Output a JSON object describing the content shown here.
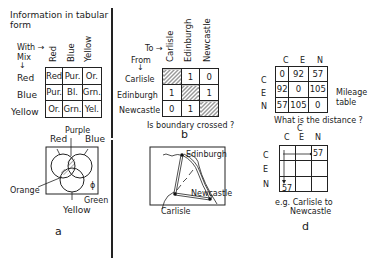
{
  "panel_a": {
    "title_line1": "Information in tabular",
    "title_line2": "form",
    "with_label": "With →",
    "mix_label": "Mix",
    "mix_arrow": "↓",
    "col_headers": [
      "Red",
      "Blue",
      "Yellow"
    ],
    "row_headers": [
      "Red",
      "Blue",
      "Yellow"
    ],
    "cells": [
      [
        "Red",
        "Pur.",
        "Or."
      ],
      [
        "Pur.",
        "Bl.",
        "Grn."
      ],
      [
        "Or.",
        "Grn.",
        "Yel."
      ]
    ],
    "venn_labels": {
      "purple": "Purple",
      "red": "Red",
      "blue": "Blue",
      "orange": "Orange",
      "green": "Green",
      "yellow": "Yellow",
      "phi": "ϕ"
    },
    "caption": "a"
  },
  "panel_b": {
    "to_label": "To →",
    "from_label": "From",
    "from_arrow": "↓",
    "col_headers": [
      "Carlisle",
      "Edinburgh",
      "Newcastle"
    ],
    "row_headers": [
      "Carlisle",
      "Edinburgh",
      "Newcastle"
    ],
    "cells": [
      [
        "",
        "1",
        "0"
      ],
      [
        "1",
        "",
        "1"
      ],
      [
        "0",
        "1",
        ""
      ]
    ],
    "question": "Is boundary crossed ?",
    "caption": "b"
  },
  "panel_c": {
    "map_labels": {
      "edinburgh": "Edinburgh",
      "newcastle": "Newcastle",
      "carlisle": "Carlisle"
    }
  },
  "panel_d": {
    "col_headers": [
      "C",
      "E",
      "N"
    ],
    "row_headers": [
      "C",
      "E",
      "N"
    ],
    "cells": [
      [
        "0",
        "92",
        "57"
      ],
      [
        "92",
        "0",
        "105"
      ],
      [
        "57",
        "105",
        "0"
      ]
    ],
    "side_label_line1": "Mileage",
    "side_label_line2": "table",
    "question": "What is the distance ?",
    "example_top_c": "C",
    "example_col_headers": [
      "C",
      "E",
      "N"
    ],
    "example_row_headers": [
      "C",
      "E",
      "N"
    ],
    "example_value_right": "57",
    "example_value_bottom": "57",
    "example_caption_line1": "e.g. Carlisle to",
    "example_caption_line2": "Newcastle",
    "caption": "d"
  }
}
